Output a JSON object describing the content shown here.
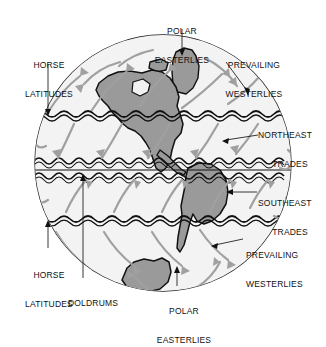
{
  "figure": {
    "kind": "global-wind-circulation-diagram",
    "background_color": "#ffffff",
    "globe": {
      "ocean_color": "#f0f0f0",
      "land_color": "#9a9a9a",
      "outline_color": "#1a1a1a",
      "center_x": 163,
      "center_y": 163,
      "radius": 128
    },
    "arrow_color": "#9c9c9c",
    "belt_line_color": "#111111"
  },
  "labels": [
    {
      "id": "polar-easterlies-north",
      "text": "POLAR\nEASTERLIES"
    },
    {
      "id": "horse-latitudes-north",
      "text": "HORSE\nLATITUDES"
    },
    {
      "id": "prevailing-westerlies-north",
      "text": "PREVAILING\nWESTERLIES"
    },
    {
      "id": "northeast-trades",
      "text": "NORTHEAST\nTRADES"
    },
    {
      "id": "southeast-trades",
      "text": "SOUTHEAST\nTRADES"
    },
    {
      "id": "prevailing-westerlies-south",
      "text": "PREVAILING\nWESTERLIES"
    },
    {
      "id": "horse-latitudes-south",
      "text": "HORSE\nLATITUDES"
    },
    {
      "id": "doldrums",
      "text": "DOLDRUMS"
    },
    {
      "id": "polar-easterlies-south",
      "text": "POLAR\nEASTERLIES"
    }
  ],
  "label_text": {
    "polar_easterlies_north_line1": "POLAR",
    "polar_easterlies_north_line2": "EASTERLIES",
    "horse_latitudes_north_line1": "HORSE",
    "horse_latitudes_north_line2": "LATITUDES",
    "prevailing_westerlies_north_line1": "PREVAILING",
    "prevailing_westerlies_north_line2": "WESTERLIES",
    "northeast_trades_line1": "NORTHEAST",
    "northeast_trades_line2": "TRADES",
    "southeast_trades_line1": "SOUTHEAST",
    "southeast_trades_line2": "TRADES",
    "prevailing_westerlies_south_line1": "PREVAILING",
    "prevailing_westerlies_south_line2": "WESTERLIES",
    "horse_latitudes_south_line1": "HORSE",
    "horse_latitudes_south_line2": "LATITUDES",
    "doldrums": "DOLDRUMS",
    "polar_easterlies_south_line1": "POLAR",
    "polar_easterlies_south_line2": "EASTERLIES"
  },
  "wind_belts": [
    {
      "name": "POLAR EASTERLIES",
      "hemisphere": "north",
      "latitude_band": "polar"
    },
    {
      "name": "PREVAILING WESTERLIES",
      "hemisphere": "north",
      "latitude_band": "mid"
    },
    {
      "name": "HORSE LATITUDES",
      "hemisphere": "north",
      "latitude_band": "subtropical-boundary"
    },
    {
      "name": "NORTHEAST TRADES",
      "hemisphere": "north",
      "latitude_band": "tropical"
    },
    {
      "name": "DOLDRUMS",
      "hemisphere": "equatorial",
      "latitude_band": "equator"
    },
    {
      "name": "SOUTHEAST TRADES",
      "hemisphere": "south",
      "latitude_band": "tropical"
    },
    {
      "name": "HORSE LATITUDES",
      "hemisphere": "south",
      "latitude_band": "subtropical-boundary"
    },
    {
      "name": "PREVAILING WESTERLIES",
      "hemisphere": "south",
      "latitude_band": "mid"
    },
    {
      "name": "POLAR EASTERLIES",
      "hemisphere": "south",
      "latitude_band": "polar"
    }
  ]
}
